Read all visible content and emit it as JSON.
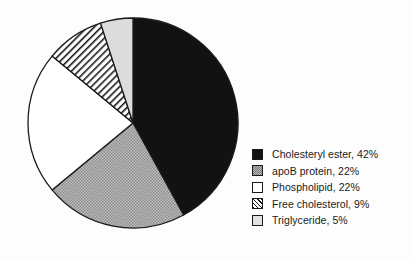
{
  "chart_data": {
    "type": "pie",
    "title": "",
    "subtitle": "",
    "xlabel": "",
    "ylabel": "",
    "legend_position": "right",
    "grid": false,
    "start_angle_deg": 0,
    "direction": "clockwise",
    "center": {
      "x": 133,
      "y": 123
    },
    "radius": 105,
    "units": "percent",
    "total": 100,
    "categories": [
      "Cholesteryl ester",
      "apoB protein",
      "Phospholipid",
      "Free cholesterol",
      "Triglyceride"
    ],
    "values": [
      42,
      22,
      22,
      9,
      5
    ],
    "slices": [
      {
        "label": "Cholesteryl ester",
        "value": 42,
        "legend_text": "Cholesteryl ester, 42%",
        "fill": "solid-black",
        "color": "#121212",
        "start_deg": 0,
        "end_deg": 151.2
      },
      {
        "label": "apoB protein",
        "value": 22,
        "legend_text": "apoB protein, 22%",
        "fill": "stipple-gray",
        "color": "#b3b3b3",
        "start_deg": 151.2,
        "end_deg": 230.4
      },
      {
        "label": "Phospholipid",
        "value": 22,
        "legend_text": "Phospholipid, 22%",
        "fill": "white",
        "color": "#ffffff",
        "start_deg": 230.4,
        "end_deg": 309.6
      },
      {
        "label": "Free cholesterol",
        "value": 9,
        "legend_text": "Free cholesterol, 9%",
        "fill": "diagonal-hatch",
        "color": "#ffffff",
        "start_deg": 309.6,
        "end_deg": 342.0
      },
      {
        "label": "Triglyceride",
        "value": 5,
        "legend_text": "Triglyceride, 5%",
        "fill": "light-gray",
        "color": "#e2e2e2",
        "start_deg": 342.0,
        "end_deg": 360.0
      }
    ]
  },
  "legend": {
    "entries": [
      {
        "label": "Cholesteryl ester, 42%"
      },
      {
        "label": "apoB protein, 22%"
      },
      {
        "label": "Phospholipid, 22%"
      },
      {
        "label": "Free cholesterol, 9%"
      },
      {
        "label": "Triglyceride, 5%"
      }
    ]
  },
  "style": {
    "background": "#fdfdfd",
    "outline": "#1a1a1a"
  }
}
